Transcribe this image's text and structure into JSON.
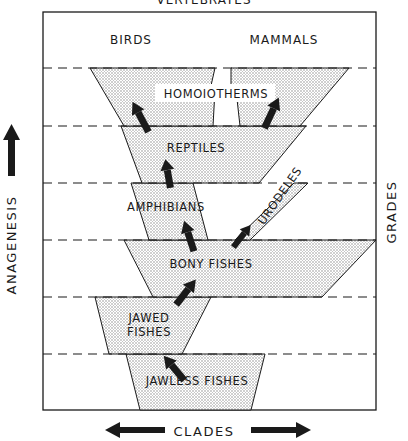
{
  "diagram": {
    "title": "VERTEBRATES",
    "top_labels": {
      "left": "BIRDS",
      "right": "MAMMALS"
    },
    "axes": {
      "vertical": {
        "label": "ANAGENESIS",
        "direction": "up"
      },
      "horizontal": {
        "label": "CLADES",
        "direction": "both"
      },
      "right": {
        "label": "GRADES"
      }
    },
    "grades": [
      {
        "label": "HOMOIOTHERMS",
        "level": 6
      },
      {
        "label": "REPTILES",
        "level": 5
      },
      {
        "label": "AMPHIBIANS",
        "level": 4
      },
      {
        "label": "BONY FISHES",
        "level": 3
      },
      {
        "label": "JAWED",
        "label2": "FISHES",
        "level": 2
      },
      {
        "label": "JAWLESS FISHES",
        "level": 1
      }
    ],
    "side_branch": {
      "label": "URODELES"
    },
    "colors": {
      "ink": "#1a1a1a",
      "stipple": "#c8c8c8",
      "background": "#ffffff"
    }
  }
}
